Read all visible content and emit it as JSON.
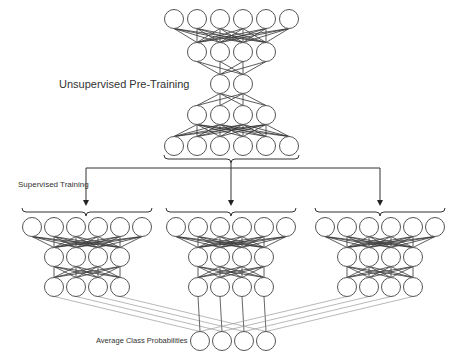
{
  "labels": {
    "unsupervised": "Unsupervised Pre-Training",
    "supervised": "Supervised Training",
    "average": "Average Class Probabilities"
  },
  "style": {
    "stroke": "#555555",
    "edge": "#333333",
    "faint_edge": "#9a9a9a",
    "circle_fill": "#ffffff",
    "radius": 9.5
  },
  "pretrain_network": {
    "layers": [
      {
        "y": 19,
        "xs": [
          174,
          197,
          220,
          243,
          266,
          289
        ]
      },
      {
        "y": 52,
        "xs": [
          197,
          220,
          243,
          266
        ]
      },
      {
        "y": 84,
        "xs": [
          220,
          243
        ]
      },
      {
        "y": 115,
        "xs": [
          197,
          220,
          243,
          266
        ]
      },
      {
        "y": 146,
        "xs": [
          174,
          197,
          220,
          243,
          266,
          289
        ]
      }
    ]
  },
  "supervised_networks": [
    {
      "center": 86,
      "layers": [
        {
          "y": 227,
          "xs": [
            32,
            54,
            76,
            98,
            120,
            142
          ]
        },
        {
          "y": 257,
          "xs": [
            54,
            76,
            98,
            120
          ]
        },
        {
          "y": 287,
          "xs": [
            54,
            76,
            98,
            120
          ]
        }
      ]
    },
    {
      "center": 231,
      "layers": [
        {
          "y": 227,
          "xs": [
            176,
            198,
            220,
            242,
            264,
            286
          ]
        },
        {
          "y": 257,
          "xs": [
            198,
            220,
            242,
            264
          ]
        },
        {
          "y": 287,
          "xs": [
            198,
            220,
            242,
            264
          ]
        }
      ]
    },
    {
      "center": 380,
      "layers": [
        {
          "y": 227,
          "xs": [
            325,
            347,
            369,
            391,
            413,
            435
          ]
        },
        {
          "y": 257,
          "xs": [
            347,
            369,
            391,
            413
          ]
        },
        {
          "y": 287,
          "xs": [
            347,
            369,
            391,
            413
          ]
        }
      ]
    }
  ],
  "output_layer": {
    "y": 341,
    "xs": [
      200,
      222,
      244,
      266
    ]
  },
  "branch": {
    "y": 168,
    "x_left": 86,
    "x_right": 380,
    "x_center": 231,
    "arrow_tip_y": 206
  }
}
